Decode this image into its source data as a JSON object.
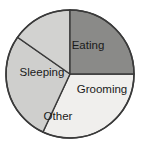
{
  "chart_data": {
    "type": "pie",
    "title": "",
    "categories": [
      "Eating",
      "Grooming",
      "Other",
      "Sleeping"
    ],
    "values": [
      32,
      25,
      15,
      28
    ],
    "labels_shown_on_slices": true,
    "legend": "none",
    "grid": false,
    "slices": [
      {
        "name": "Eating",
        "label": "Eating",
        "value": 32,
        "color": "#f0efed",
        "start_angle_deg": 0,
        "end_angle_deg": 115,
        "label_x": 88,
        "label_y": 46
      },
      {
        "name": "Sleeping",
        "label": "Sleeping",
        "value": 28,
        "color": "#cfcfcd",
        "start_angle_deg": 115,
        "end_angle_deg": 215,
        "label_x": 42,
        "label_y": 73
      },
      {
        "name": "Other",
        "label": "Other",
        "value": 15,
        "color": "#d2d2d0",
        "start_angle_deg": 215,
        "end_angle_deg": 270,
        "label_x": 58,
        "label_y": 117
      },
      {
        "name": "Grooming",
        "label": "Grooming",
        "value": 25,
        "color": "#8a8a88",
        "start_angle_deg": 270,
        "end_angle_deg": 360,
        "label_x": 102,
        "label_y": 90
      }
    ],
    "geometry": {
      "center_x": 70,
      "center_y": 74,
      "radius": 64
    },
    "style": {
      "background": "#ffffff",
      "outline_color": "#3a3a3a",
      "label_color": "#1a1a1a"
    }
  }
}
